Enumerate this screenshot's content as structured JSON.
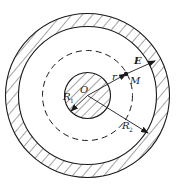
{
  "diagram": {
    "type": "concentric-spherical-capacitor",
    "colors": {
      "stroke": "#1a1a1a",
      "background": "#ffffff"
    },
    "labels": {
      "center": "O",
      "point": "M",
      "field": "E",
      "radius_var": "r",
      "inner_radius": "R",
      "inner_radius_sub": "1",
      "outer_radius": "R",
      "outer_radius_sub": "2"
    },
    "elements": [
      {
        "name": "outer-shell",
        "style": "hatched-ring",
        "outer_radius_px": 82,
        "inner_radius_px": 69
      },
      {
        "name": "gaussian-surface",
        "style": "dashed-circle",
        "radius_px": 45
      },
      {
        "name": "inner-sphere",
        "style": "hatched-disk",
        "radius_px": 23
      },
      {
        "name": "field-arrow",
        "label": "E",
        "direction": "radial-outward"
      },
      {
        "name": "r-arrow",
        "label": "r",
        "from": "O",
        "to": "M"
      },
      {
        "name": "R1-arrow",
        "label": "R1"
      },
      {
        "name": "R2-arrow",
        "label": "R2"
      }
    ]
  }
}
